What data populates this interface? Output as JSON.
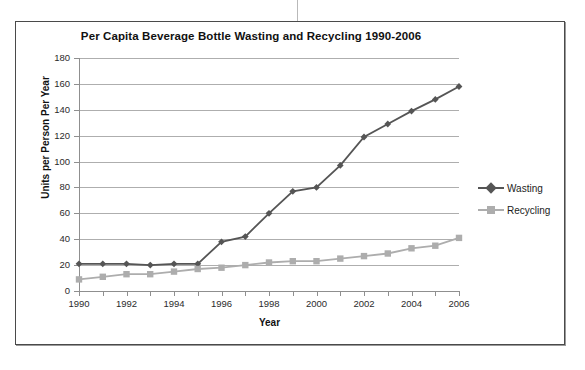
{
  "chart_data": {
    "type": "line",
    "title": "Per Capita Beverage Bottle Wasting and Recycling 1990-2006",
    "xlabel": "Year",
    "ylabel": "Units per Person Per Year",
    "x": [
      1990,
      1991,
      1992,
      1993,
      1994,
      1995,
      1996,
      1997,
      1998,
      1999,
      2000,
      2001,
      2002,
      2003,
      2004,
      2005,
      2006
    ],
    "xtick_labels": [
      "1990",
      "1992",
      "1994",
      "1996",
      "1998",
      "2000",
      "2002",
      "2004",
      "2006"
    ],
    "xtick_values": [
      1990,
      1992,
      1994,
      1996,
      1998,
      2000,
      2002,
      2004,
      2006
    ],
    "ytick_labels": [
      "0",
      "20",
      "40",
      "60",
      "80",
      "100",
      "120",
      "140",
      "160",
      "180"
    ],
    "ytick_values": [
      0,
      20,
      40,
      60,
      80,
      100,
      120,
      140,
      160,
      180
    ],
    "ylim": [
      0,
      180
    ],
    "xlim": [
      1990,
      2006
    ],
    "grid": "horizontal",
    "legend_position": "right",
    "series": [
      {
        "name": "Wasting",
        "marker": "diamond",
        "color": "#555555",
        "values": [
          21,
          21,
          21,
          20,
          21,
          21,
          38,
          42,
          60,
          77,
          80,
          97,
          119,
          129,
          139,
          148,
          158
        ]
      },
      {
        "name": "Recycling",
        "marker": "square",
        "color": "#adadad",
        "values": [
          9,
          11,
          13,
          13,
          15,
          17,
          18,
          20,
          22,
          23,
          23,
          25,
          27,
          29,
          33,
          35,
          41
        ]
      }
    ]
  },
  "colors": {
    "wasting": "#555555",
    "recycling": "#adadad",
    "gridline": "#aeaeae",
    "axis": "#8f8f8f",
    "frame": "#4a4a4a"
  }
}
